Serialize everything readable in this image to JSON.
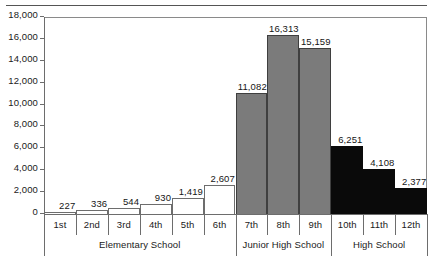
{
  "chart_data": {
    "type": "bar",
    "title": "",
    "subtitle": "",
    "xlabel": "",
    "ylabel": "",
    "categories": [
      "1st",
      "2nd",
      "3rd",
      "4th",
      "5th",
      "6th",
      "7th",
      "8th",
      "9th",
      "10th",
      "11th",
      "12th"
    ],
    "values": [
      227,
      336,
      544,
      930,
      1419,
      2607,
      11082,
      16313,
      15159,
      6251,
      4108,
      2377
    ],
    "value_labels": [
      "227",
      "336",
      "544",
      "930",
      "1,419",
      "2,607",
      "11,082",
      "16,313",
      "15,159",
      "6,251",
      "4,108",
      "2,377"
    ],
    "ylim": [
      0,
      18000
    ],
    "ytick_values": [
      0,
      2000,
      4000,
      6000,
      8000,
      10000,
      12000,
      14000,
      16000,
      18000
    ],
    "ytick_labels": [
      "0",
      "2,000",
      "4,000",
      "6,000",
      "8,000",
      "10,000",
      "12,000",
      "14,000",
      "16,000",
      "18,000"
    ],
    "grid": false,
    "legend": "none",
    "groups": [
      {
        "label": "Elementary School",
        "start_index": 0,
        "end_index": 5,
        "fill": "white"
      },
      {
        "label": "Junior High School",
        "start_index": 6,
        "end_index": 8,
        "fill": "gray"
      },
      {
        "label": "High School",
        "start_index": 9,
        "end_index": 11,
        "fill": "black"
      }
    ],
    "series_fill_colors": {
      "white": "#ffffff",
      "gray": "#7b7b7b",
      "black": "#0a0a0a"
    },
    "axis_color": "#6d6d6d"
  }
}
